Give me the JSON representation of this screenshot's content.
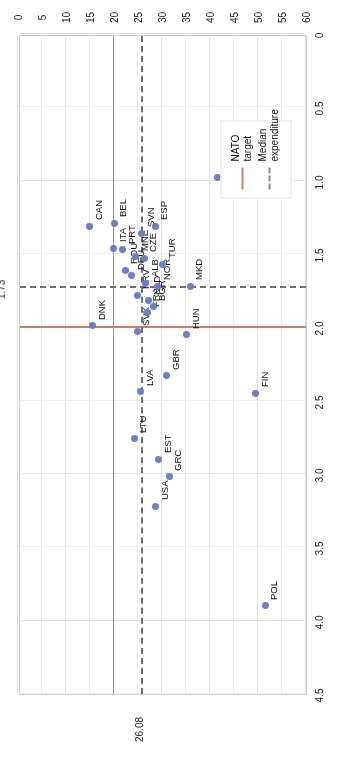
{
  "chart_data": {
    "type": "scatter",
    "title": "",
    "xlabel": "Defence expenditure as a percentage of GDP",
    "ylabel": "Equipment expenditure as a percentage of\ndefense expenditure",
    "xlim": [
      0,
      4.5
    ],
    "ylim": [
      0,
      60
    ],
    "xticks": [
      "0",
      "0.5",
      "1.0",
      "1.5",
      "2.0",
      "2.5",
      "3.0",
      "3.5",
      "4.0",
      "4.5"
    ],
    "yticks": [
      "0",
      "5",
      "10",
      "15",
      "20",
      "25",
      "30",
      "35",
      "40",
      "45",
      "50",
      "55",
      "60"
    ],
    "grid": true,
    "legend_position": "lower-left",
    "reference_lines": [
      {
        "name": "NATO target",
        "style": "solid",
        "color": "#d8786a",
        "x": 2.0,
        "y": 20
      },
      {
        "name": "Median expenditure",
        "style": "dashed",
        "color": "#6e6e6e",
        "x": 1.73,
        "y": 26.08
      }
    ],
    "annotations": [
      {
        "text": "1.73",
        "axis": "x",
        "value": 1.73
      },
      {
        "text": "26.08",
        "axis": "y",
        "value": 26.08
      }
    ],
    "points": [
      {
        "label": "POL",
        "x": 3.9,
        "y": 51.5
      },
      {
        "label": "LUX",
        "x": 0.98,
        "y": 41.6
      },
      {
        "label": "FIN",
        "x": 2.45,
        "y": 49.5
      },
      {
        "label": "GRC",
        "x": 3.02,
        "y": 31.5
      },
      {
        "label": "USA",
        "x": 3.22,
        "y": 28.7
      },
      {
        "label": "EST",
        "x": 2.9,
        "y": 29.3
      },
      {
        "label": "LTU",
        "x": 2.76,
        "y": 24.2
      },
      {
        "label": "LVA",
        "x": 2.44,
        "y": 25.6
      },
      {
        "label": "GBR",
        "x": 2.33,
        "y": 31.0
      },
      {
        "label": "HUN",
        "x": 2.05,
        "y": 35.2
      },
      {
        "label": "SVK",
        "x": 2.03,
        "y": 24.8
      },
      {
        "label": "DNK",
        "x": 1.99,
        "y": 15.6
      },
      {
        "label": "FRA",
        "x": 1.9,
        "y": 26.9
      },
      {
        "label": "BGR",
        "x": 1.86,
        "y": 28.2
      },
      {
        "label": "NLD",
        "x": 1.82,
        "y": 27.1
      },
      {
        "label": "HRV",
        "x": 1.78,
        "y": 24.8
      },
      {
        "label": "MKD",
        "x": 1.72,
        "y": 35.9
      },
      {
        "label": "NOR",
        "x": 1.72,
        "y": 29.1
      },
      {
        "label": "ALB",
        "x": 1.7,
        "y": 26.6
      },
      {
        "label": "DEU",
        "x": 1.65,
        "y": 23.7
      },
      {
        "label": "ROU",
        "x": 1.61,
        "y": 22.3
      },
      {
        "label": "TUR",
        "x": 1.57,
        "y": 30.2
      },
      {
        "label": "CZE",
        "x": 1.53,
        "y": 26.3
      },
      {
        "label": "MNE",
        "x": 1.52,
        "y": 24.5
      },
      {
        "label": "PRT",
        "x": 1.47,
        "y": 21.8
      },
      {
        "label": "ITA",
        "x": 1.46,
        "y": 20.0
      },
      {
        "label": "SVN",
        "x": 1.36,
        "y": 25.8
      },
      {
        "label": "ESP",
        "x": 1.31,
        "y": 28.6
      },
      {
        "label": "BEL",
        "x": 1.29,
        "y": 20.1
      },
      {
        "label": "CAN",
        "x": 1.31,
        "y": 15.0
      }
    ]
  },
  "legend": {
    "items": [
      {
        "label": "NATO target",
        "style": "solid"
      },
      {
        "label": "Median\nexpenditure",
        "style": "dashed"
      }
    ]
  },
  "axis": {
    "y_title": "Equipment expenditure as a percentage of\ndefense expenditure"
  }
}
